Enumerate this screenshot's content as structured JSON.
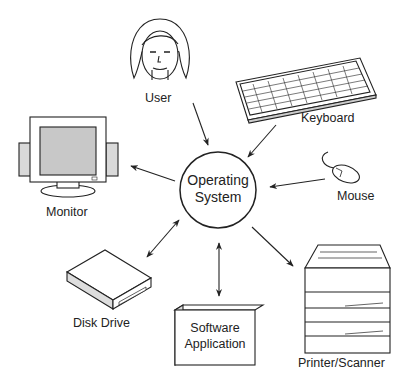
{
  "diagram": {
    "center": {
      "line1": "Operating",
      "line2": "System"
    },
    "nodes": {
      "user": {
        "label": "User",
        "icon": "user-face-icon",
        "arrow": "to-center"
      },
      "keyboard": {
        "label": "Keyboard",
        "icon": "keyboard-icon",
        "arrow": "to-center"
      },
      "mouse": {
        "label": "Mouse",
        "icon": "mouse-icon",
        "arrow": "to-center"
      },
      "monitor": {
        "label": "Monitor",
        "icon": "monitor-icon",
        "arrow": "from-center"
      },
      "printer": {
        "label": "Printer/Scanner",
        "icon": "printer-icon",
        "arrow": "from-center"
      },
      "disk": {
        "label": "Disk Drive",
        "icon": "disk-drive-icon",
        "arrow": "bidirectional"
      },
      "software": {
        "line1": "Software",
        "line2": "Application",
        "icon": "software-box-icon",
        "arrow": "bidirectional"
      }
    },
    "colors": {
      "line": "#222222",
      "screen": "#c8c8c8",
      "panel": "#d9d9d9"
    }
  }
}
